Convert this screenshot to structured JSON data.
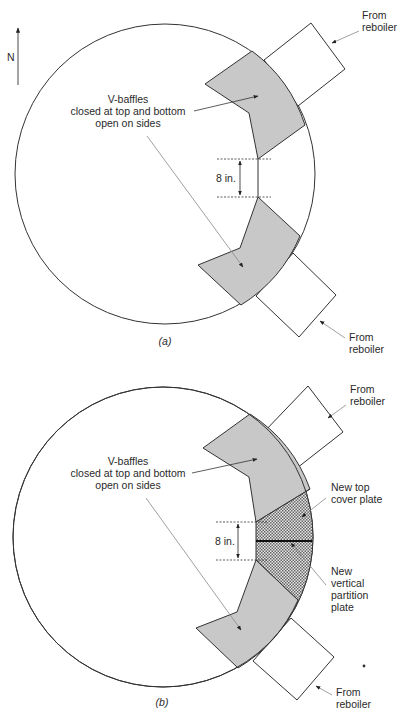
{
  "compass": {
    "label": "N"
  },
  "figure_a": {
    "caption": "(a)",
    "baffle_label": [
      "V-baffles",
      "closed at top and bottom",
      "open on sides"
    ],
    "dimension_label": "8 in.",
    "reboiler_top_label": [
      "From",
      "reboiler"
    ],
    "reboiler_bottom_label": [
      "From",
      "reboiler"
    ]
  },
  "figure_b": {
    "caption": "(b)",
    "baffle_label": [
      "V-baffles",
      "closed at top and bottom",
      "open on sides"
    ],
    "dimension_label": "8 in.",
    "reboiler_top_label": [
      "From",
      "reboiler"
    ],
    "reboiler_bottom_label": [
      "From",
      "reboiler"
    ],
    "top_cover_label": [
      "New top",
      "cover plate"
    ],
    "partition_label": [
      "New",
      "vertical",
      "partition",
      "plate"
    ]
  },
  "colors": {
    "baffle_fill": "#c8c8c8",
    "outline": "#333333",
    "hatch": "#555555"
  }
}
